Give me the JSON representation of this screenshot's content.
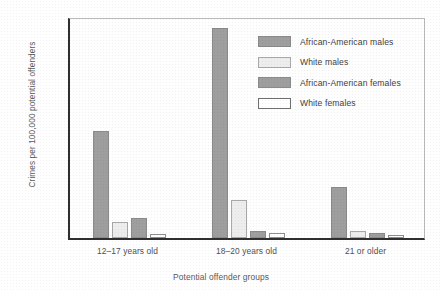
{
  "chart_data": {
    "type": "bar",
    "title": "",
    "xlabel": "Potential offender groups",
    "ylabel": "Crimes per 100,000 potential offenders",
    "categories": [
      "12–17 years old",
      "18–20 years old",
      "21 or older"
    ],
    "ylim": [
      0,
      90000
    ],
    "yticks": [
      0,
      10000,
      20000,
      30000,
      40000,
      50000,
      60000,
      70000,
      80000,
      90000
    ],
    "ytick_labels": [
      "0",
      "10,000",
      "20,000",
      "30,000",
      "40,000",
      "50,000",
      "60,000",
      "70,000",
      "80,000",
      "90,000"
    ],
    "grid": false,
    "legend_position": "upper right",
    "series": [
      {
        "name": "African-American males",
        "color": "#9e9e9e",
        "values": [
          43500,
          85000,
          20500
        ]
      },
      {
        "name": "White males",
        "color": "#ededed",
        "values": [
          6500,
          15500,
          3000
        ]
      },
      {
        "name": "African-American females",
        "color": "#9e9e9e",
        "values": [
          8000,
          3000,
          2000
        ]
      },
      {
        "name": "White females",
        "color": "#ffffff",
        "values": [
          1500,
          2000,
          1200
        ]
      }
    ]
  }
}
